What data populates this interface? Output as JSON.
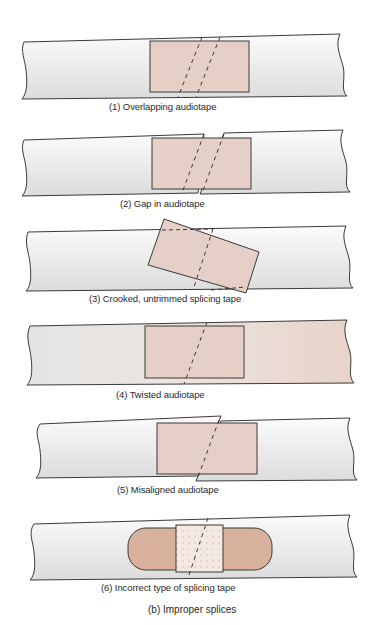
{
  "figure": {
    "title": "(b) Improper splices",
    "colors": {
      "tape_base": "#e8e8e8",
      "tape_light": "#f8f8f8",
      "splice_fill": "#e5cfc6",
      "bandage_fill": "#d9b29d",
      "bandage_pad": "#f3e6df",
      "outline": "#3a3a3a"
    }
  },
  "panels": [
    {
      "number": 1,
      "caption": "(1) Overlapping audiotape"
    },
    {
      "number": 2,
      "caption": "(2) Gap in audiotape"
    },
    {
      "number": 3,
      "caption": "(3) Crooked, untrimmed splicing tape"
    },
    {
      "number": 4,
      "caption": "(4) Twisted audiotape"
    },
    {
      "number": 5,
      "caption": "(5) Misaligned audiotape"
    },
    {
      "number": 6,
      "caption": "(6) Incorrect type of splicing tape"
    }
  ]
}
